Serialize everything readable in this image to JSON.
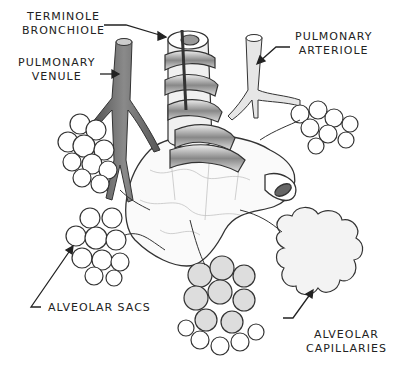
{
  "diagram": {
    "labels": {
      "terminole_bronchiole": {
        "line1": "TERMINOLE",
        "line2": "BRONCHIOLE"
      },
      "pulmonary_venule": {
        "line1": "PULMONARY",
        "line2": "VENULE"
      },
      "pulmonary_arteriole": {
        "line1": "PULMONARY",
        "line2": "ARTERIOLE"
      },
      "alveolar_sacs": {
        "line1": "ALVEOLAR SACS"
      },
      "alveolar_capillaries": {
        "line1": "ALVEOLAR",
        "line2": "CAPILLARIES"
      }
    },
    "colors": {
      "ink": "#222222",
      "vein_fill": "#6b6b6b",
      "artery_fill": "#d8d8d8",
      "background": "#ffffff"
    }
  }
}
